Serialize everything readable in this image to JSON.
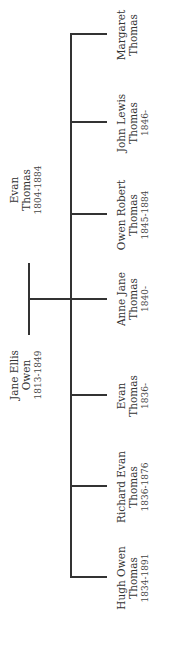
{
  "parents": [
    {
      "name_line1": "Evan",
      "name_line2": "Thomas",
      "years": "1804-1884"
    },
    {
      "name_line1": "Jane Ellis",
      "name_line2": "Owen",
      "years": "1813-1849"
    }
  ],
  "children": [
    {
      "name_line1": "Hugh Owen",
      "name_line2": "Thomas",
      "years": "1834-1891"
    },
    {
      "name_line1": "Richard Evan",
      "name_line2": "Thomas",
      "years": "1836-1876"
    },
    {
      "name_line1": "Evan",
      "name_line2": "Thomas",
      "years": "1836-"
    },
    {
      "name_line1": "Anne Jane",
      "name_line2": "Thomas",
      "years": "1840-"
    },
    {
      "name_line1": "Owen Robert",
      "name_line2": "Thomas",
      "years": "1845-1884"
    },
    {
      "name_line1": "John Lewis",
      "name_line2": "Thomas",
      "years": "1846-"
    },
    {
      "name_line1": "Margaret",
      "name_line2": "Thomas",
      "years": ""
    }
  ]
}
